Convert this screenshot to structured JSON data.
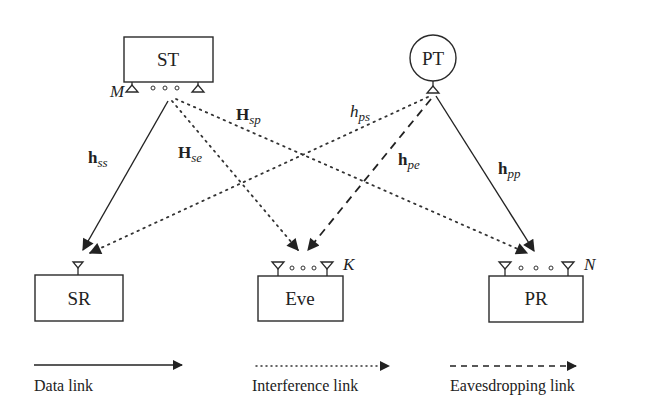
{
  "nodes": {
    "st": {
      "label": "ST",
      "antenna_count_label": "M"
    },
    "pt": {
      "label": "PT"
    },
    "sr": {
      "label": "SR"
    },
    "eve": {
      "label": "Eve",
      "antenna_count_label": "K"
    },
    "pr": {
      "label": "PR",
      "antenna_count_label": "N"
    }
  },
  "channels": {
    "h_ss": {
      "main": "h",
      "sub": "ss",
      "bold": true,
      "link_type": "data",
      "from": "ST",
      "to": "SR"
    },
    "H_se": {
      "main": "H",
      "sub": "se",
      "bold": true,
      "link_type": "interference",
      "from": "ST",
      "to": "Eve"
    },
    "H_sp": {
      "main": "H",
      "sub": "sp",
      "bold": true,
      "link_type": "interference",
      "from": "ST",
      "to": "PR"
    },
    "h_ps": {
      "main": "h",
      "sub": "ps",
      "bold": false,
      "link_type": "interference",
      "from": "PT",
      "to": "SR"
    },
    "h_pe": {
      "main": "h",
      "sub": "pe",
      "bold": true,
      "link_type": "eavesdropping",
      "from": "PT",
      "to": "Eve"
    },
    "h_pp": {
      "main": "h",
      "sub": "pp",
      "bold": true,
      "link_type": "data",
      "from": "PT",
      "to": "PR"
    }
  },
  "legend": {
    "data": "Data link",
    "interference": "Interference link",
    "eavesdropping": "Eavesdropping link"
  },
  "colors": {
    "stroke": "#222222",
    "background": "#ffffff"
  }
}
